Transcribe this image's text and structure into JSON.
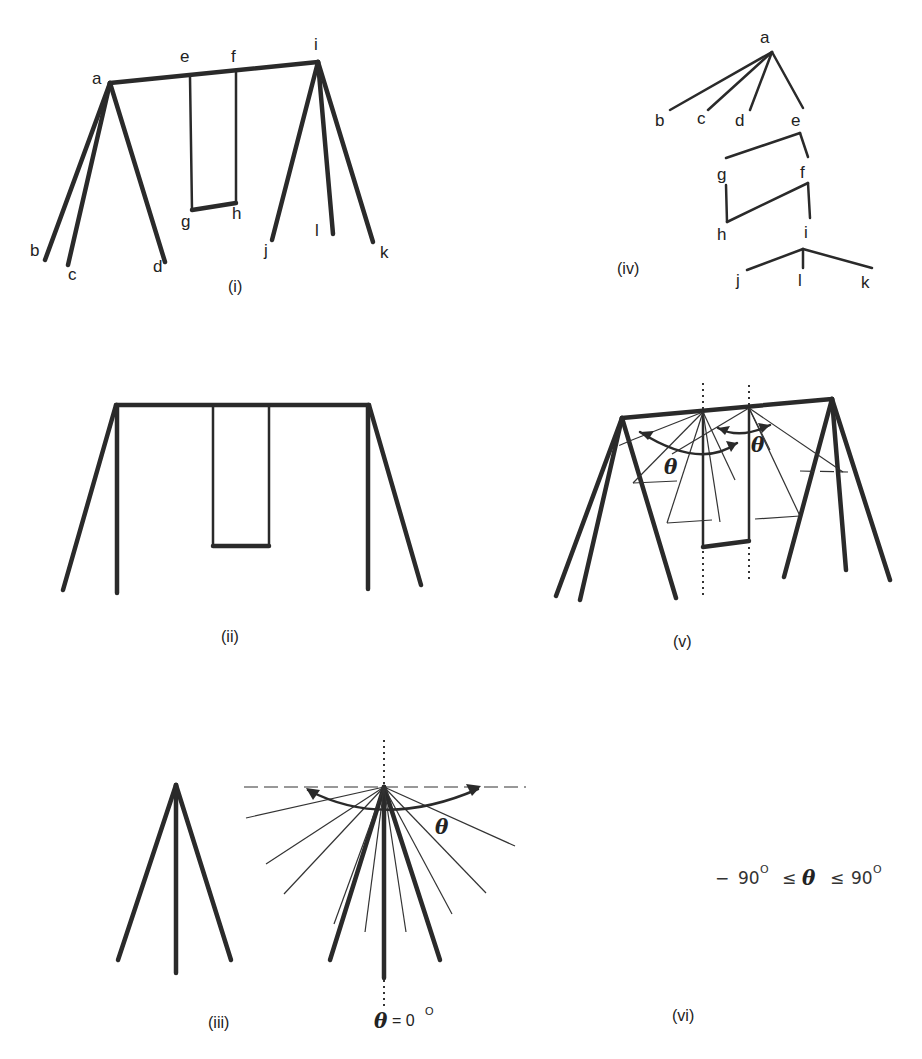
{
  "figure": {
    "panels": [
      {
        "id": "i",
        "caption": "(i)",
        "title": "Swing set with labeled joints",
        "labels": [
          "a",
          "b",
          "c",
          "d",
          "e",
          "f",
          "g",
          "h",
          "i",
          "j",
          "k",
          "l"
        ]
      },
      {
        "id": "ii",
        "caption": "(ii)",
        "title": "Swing set front view"
      },
      {
        "id": "iii",
        "caption": "(iii)",
        "title": "A-frame leg and angle sweep",
        "angle_label": "θ",
        "zero_label": "θ = 0°",
        "zero_prefix": "= 0",
        "zero_sup": "O"
      },
      {
        "id": "iv",
        "caption": "(iv)",
        "title": "Tree hierarchy of joints",
        "nodes": [
          "a",
          "b",
          "c",
          "d",
          "e",
          "g",
          "f",
          "h",
          "i",
          "j",
          "l",
          "k"
        ],
        "edges": [
          [
            "a",
            "b"
          ],
          [
            "a",
            "c"
          ],
          [
            "a",
            "d"
          ],
          [
            "a",
            "e"
          ],
          [
            "e",
            "g"
          ],
          [
            "e",
            "f"
          ],
          [
            "g",
            "h"
          ],
          [
            "h",
            "f"
          ],
          [
            "f",
            "i"
          ],
          [
            "i",
            "j"
          ],
          [
            "i",
            "l"
          ],
          [
            "i",
            "k"
          ]
        ]
      },
      {
        "id": "v",
        "caption": "(v)",
        "title": "Swing set with rotation sweeps",
        "angle_label": "θ"
      },
      {
        "id": "vi",
        "caption": "(vi)",
        "title": "Angle range",
        "inequality": {
          "minus": "−",
          "left": "90",
          "left_sup": "O",
          "op1": "≤",
          "theta": "θ",
          "op2": "≤",
          "right": "90",
          "right_sup": "O"
        }
      }
    ]
  }
}
